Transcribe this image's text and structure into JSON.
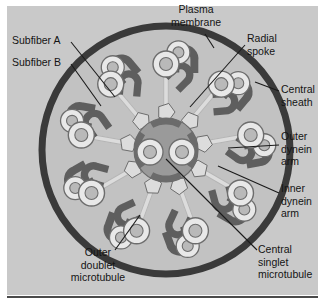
{
  "figure": {
    "panel_color": "#c9c9c9",
    "background_color": "#ffffff"
  },
  "colors": {
    "plasma_membrane": "#3a3a3a",
    "cytoplasm": "#c2c2c2",
    "microtubule_wall": "#e8e8e8",
    "microtubule_outline": "#6d6d6d",
    "microtubule_lumen": "#b9b9b9",
    "dynein_arm": "#5e5e5e",
    "radial_spoke": "#dcdcdc",
    "central_sheath": "#9a9a9a",
    "central_sheath_arc": "#6b6b6b",
    "leader_line": "#1a1a1a",
    "label_text": "#141414",
    "baseline_rule": "#4a4a4a"
  },
  "labels": [
    {
      "id": "plasma-membrane",
      "lines": [
        "Plasma",
        "membrane"
      ],
      "x": 196,
      "y": 13,
      "anchor": "middle"
    },
    {
      "id": "radial-spoke",
      "lines": [
        "Radial",
        "spoke"
      ],
      "x": 247,
      "y": 42,
      "anchor": "start"
    },
    {
      "id": "subfiber-a",
      "lines": [
        "Subfiber A"
      ],
      "x": 12,
      "y": 44,
      "anchor": "start"
    },
    {
      "id": "subfiber-b",
      "lines": [
        "Subfiber B"
      ],
      "x": 12,
      "y": 66,
      "anchor": "start"
    },
    {
      "id": "central-sheath",
      "lines": [
        "Central",
        "sheath"
      ],
      "x": 281,
      "y": 93,
      "anchor": "start"
    },
    {
      "id": "outer-dynein-arm",
      "lines": [
        "Outer",
        "dynein",
        "arm"
      ],
      "x": 281,
      "y": 140,
      "anchor": "start"
    },
    {
      "id": "inner-dynein-arm",
      "lines": [
        "Inner",
        "dynein",
        "arm"
      ],
      "x": 281,
      "y": 192,
      "anchor": "start"
    },
    {
      "id": "central-singlet-microtubule",
      "lines": [
        "Central",
        "singlet",
        "microtubule"
      ],
      "x": 258,
      "y": 253,
      "anchor": "start"
    },
    {
      "id": "outer-doublet-microtubule",
      "lines": [
        "Outer",
        "doublet",
        "microtubule"
      ],
      "x": 98,
      "y": 256,
      "anchor": "middle"
    }
  ],
  "leaders": [
    {
      "id": "leader-plasma-membrane",
      "d": "M 205 34 L 214 48"
    },
    {
      "id": "leader-radial-spoke",
      "d": "M 245 45 L 190 107"
    },
    {
      "id": "leader-subfiber-a",
      "d": "M 71 42 L 115 97"
    },
    {
      "id": "leader-subfiber-b",
      "d": "M 71 64 L 101 106"
    },
    {
      "id": "leader-central-sheath",
      "d": "M 279 91 L 255 82"
    },
    {
      "id": "leader-outer-dynein-arm",
      "d": "M 279 145 L 228 148"
    },
    {
      "id": "leader-inner-dynein-arm",
      "d": "M 279 193 L 218 166"
    },
    {
      "id": "leader-central-singlet",
      "d": "M 257 250 L 166 159"
    },
    {
      "id": "leader-outer-doublet",
      "d": "M 115 250 L 140 215"
    }
  ],
  "structure": {
    "center": {
      "x": 166,
      "y": 150
    },
    "plasma_membrane": {
      "radius": 126,
      "stroke_width": 7
    },
    "cytoplasm_radius": 122,
    "doublet_count": 9,
    "doublet_orbit_radius": 86,
    "central_sheath": {
      "radius": 32
    },
    "central_singlets": [
      {
        "id": "central-singlet-left",
        "cx": -16,
        "cy": 2,
        "r_outer": 13,
        "r_inner": 6.5
      },
      {
        "id": "central-singlet-right",
        "cx": 16,
        "cy": 2,
        "r_outer": 13,
        "r_inner": 6.5
      }
    ],
    "subfiber_a": {
      "r_outer": 13,
      "r_inner": 6.5
    },
    "subfiber_b": {
      "r_outer": 11.5,
      "r_inner": 5.5
    },
    "radial_spoke": {
      "stalk_length": 36,
      "head_size": 9
    }
  },
  "parts_legend": {
    "plasma_membrane": "Plasma membrane",
    "radial_spoke": "Radial spoke",
    "central_sheath": "Central sheath",
    "central_singlet_microtubule": "Central singlet microtubule",
    "outer_doublet_microtubule": "Outer doublet microtubule",
    "outer_dynein_arm": "Outer dynein arm",
    "inner_dynein_arm": "Inner dynein arm",
    "subfiber_a": "Subfiber A",
    "subfiber_b": "Subfiber B"
  }
}
